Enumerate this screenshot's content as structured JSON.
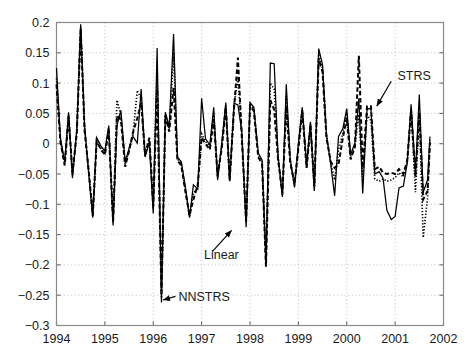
{
  "chart_data": {
    "type": "line",
    "title": "",
    "xlabel": "",
    "ylabel": "",
    "xlim": [
      1994,
      2002
    ],
    "ylim": [
      -0.3,
      0.2
    ],
    "grid": true,
    "legend_position": "none",
    "x_ticks": [
      1994,
      1995,
      1996,
      1997,
      1998,
      1999,
      2000,
      2001,
      2002
    ],
    "x_tick_labels": [
      "1994",
      "1995",
      "1996",
      "1997",
      "1998",
      "1999",
      "2000",
      "2001",
      "2002"
    ],
    "y_ticks": [
      0.2,
      0.15,
      0.1,
      0.05,
      0,
      -0.05,
      -0.1,
      -0.15,
      -0.2,
      -0.25,
      -0.3
    ],
    "y_tick_labels": [
      "0.2",
      "0.15",
      "0.1",
      "0.05",
      "0",
      "-0.05",
      "-0.1",
      "-0.15",
      "-0.2",
      "-0.25",
      "-0.3"
    ],
    "annotations": [
      {
        "text": "STRS",
        "label_x": 2001.05,
        "label_y": 0.112,
        "arrow_from_x": 2000.92,
        "arrow_from_y": 0.103,
        "arrow_to_x": 2000.62,
        "arrow_to_y": 0.062
      },
      {
        "text": "Linear",
        "label_x": 1997.05,
        "label_y": -0.183,
        "arrow_from_x": 1997.22,
        "arrow_from_y": -0.178,
        "arrow_to_x": 1997.62,
        "arrow_to_y": -0.143
      },
      {
        "text": "NNSTRS",
        "label_x": 1996.52,
        "label_y": -0.252,
        "arrow_from_x": 1996.46,
        "arrow_from_y": -0.252,
        "arrow_to_x": 1996.2,
        "arrow_to_y": -0.258
      }
    ],
    "series": [
      {
        "name": "Linear",
        "style": "solid",
        "x": [
          1994.0,
          1994.08,
          1994.17,
          1994.25,
          1994.33,
          1994.42,
          1994.5,
          1994.58,
          1994.67,
          1994.75,
          1994.83,
          1994.92,
          1995.0,
          1995.08,
          1995.17,
          1995.25,
          1995.33,
          1995.42,
          1995.5,
          1995.58,
          1995.67,
          1995.75,
          1995.83,
          1995.92,
          1996.0,
          1996.08,
          1996.17,
          1996.25,
          1996.33,
          1996.42,
          1996.5,
          1996.58,
          1996.67,
          1996.75,
          1996.83,
          1996.92,
          1997.0,
          1997.08,
          1997.17,
          1997.25,
          1997.33,
          1997.42,
          1997.5,
          1997.58,
          1997.67,
          1997.75,
          1997.83,
          1997.92,
          1998.0,
          1998.08,
          1998.17,
          1998.25,
          1998.33,
          1998.42,
          1998.5,
          1998.58,
          1998.67,
          1998.75,
          1998.83,
          1998.92,
          1999.0,
          1999.08,
          1999.17,
          1999.25,
          1999.33,
          1999.42,
          1999.5,
          1999.58,
          1999.67,
          1999.75,
          1999.83,
          1999.92,
          2000.0,
          2000.08,
          2000.17,
          2000.25,
          2000.33,
          2000.42,
          2000.5,
          2000.58,
          2000.67,
          2000.75,
          2000.83,
          2000.92,
          2001.0,
          2001.08,
          2001.17,
          2001.25,
          2001.33,
          2001.42,
          2001.5,
          2001.58,
          2001.67,
          2001.72
        ],
        "y": [
          0.125,
          0.01,
          -0.03,
          0.052,
          -0.057,
          0.024,
          0.197,
          0.03,
          -0.053,
          -0.122,
          0.01,
          -0.004,
          -0.012,
          0.03,
          -0.135,
          0.03,
          0.055,
          -0.03,
          -0.008,
          0.012,
          0.001,
          0.09,
          -0.022,
          0.002,
          -0.115,
          0.158,
          -0.262,
          0.052,
          0.028,
          0.181,
          -0.022,
          -0.03,
          -0.075,
          -0.122,
          -0.068,
          -0.075,
          0.075,
          0.008,
          -0.002,
          0.06,
          -0.06,
          0.003,
          0.068,
          -0.062,
          0.067,
          0.064,
          0.02,
          -0.138,
          0.068,
          0.06,
          -0.015,
          -0.027,
          -0.196,
          0.133,
          0.132,
          -0.02,
          -0.088,
          0.098,
          -0.024,
          -0.072,
          0.0,
          0.06,
          -0.035,
          0.036,
          -0.078,
          0.157,
          0.13,
          0.016,
          -0.035,
          -0.086,
          0.012,
          0.025,
          0.058,
          -0.018,
          0.002,
          0.075,
          -0.082,
          0.057,
          0.058,
          -0.05,
          -0.046,
          -0.057,
          -0.11,
          -0.125,
          -0.12,
          -0.073,
          -0.07,
          -0.032,
          0.065,
          -0.047,
          0.081,
          -0.08,
          -0.06,
          0.012
        ]
      },
      {
        "name": "STRS",
        "style": "dashed",
        "x": [
          1994.0,
          1994.08,
          1994.17,
          1994.25,
          1994.33,
          1994.42,
          1994.5,
          1994.58,
          1994.67,
          1994.75,
          1994.83,
          1994.92,
          1995.0,
          1995.08,
          1995.17,
          1995.25,
          1995.33,
          1995.42,
          1995.5,
          1995.58,
          1995.67,
          1995.75,
          1995.83,
          1995.92,
          1996.0,
          1996.08,
          1996.17,
          1996.25,
          1996.33,
          1996.42,
          1996.5,
          1996.58,
          1996.67,
          1996.75,
          1996.83,
          1996.92,
          1997.0,
          1997.08,
          1997.17,
          1997.25,
          1997.33,
          1997.42,
          1997.5,
          1997.58,
          1997.67,
          1997.75,
          1997.83,
          1997.92,
          1998.0,
          1998.08,
          1998.17,
          1998.25,
          1998.33,
          1998.42,
          1998.5,
          1998.58,
          1998.67,
          1998.75,
          1998.83,
          1998.92,
          1999.0,
          1999.08,
          1999.17,
          1999.25,
          1999.33,
          1999.42,
          1999.5,
          1999.58,
          1999.67,
          1999.75,
          1999.83,
          1999.92,
          2000.0,
          2000.08,
          2000.17,
          2000.25,
          2000.33,
          2000.42,
          2000.5,
          2000.58,
          2000.67,
          2000.75,
          2000.83,
          2000.92,
          2001.0,
          2001.08,
          2001.17,
          2001.25,
          2001.33,
          2001.42,
          2001.5,
          2001.58,
          2001.67,
          2001.72
        ],
        "y": [
          0.098,
          0.004,
          -0.036,
          0.045,
          -0.048,
          0.018,
          0.19,
          0.022,
          -0.048,
          -0.118,
          0.004,
          -0.01,
          -0.018,
          0.022,
          -0.128,
          0.046,
          0.04,
          -0.038,
          -0.012,
          0.018,
          0.042,
          0.068,
          -0.018,
          0.01,
          -0.104,
          0.09,
          -0.25,
          0.046,
          0.02,
          0.092,
          -0.028,
          -0.036,
          -0.082,
          -0.118,
          -0.092,
          -0.068,
          0.01,
          0.0,
          -0.01,
          0.04,
          -0.052,
          -0.005,
          0.06,
          -0.06,
          0.058,
          0.142,
          0.012,
          -0.128,
          0.062,
          0.054,
          -0.022,
          -0.033,
          -0.203,
          0.072,
          0.056,
          -0.026,
          -0.082,
          0.062,
          -0.03,
          -0.066,
          -0.008,
          0.054,
          -0.04,
          0.03,
          -0.07,
          0.14,
          0.118,
          0.01,
          -0.03,
          -0.04,
          -0.034,
          0.01,
          0.042,
          -0.026,
          -0.005,
          0.145,
          -0.04,
          0.062,
          0.062,
          -0.042,
          -0.038,
          -0.048,
          -0.05,
          -0.048,
          -0.05,
          -0.042,
          -0.05,
          -0.028,
          0.055,
          -0.055,
          0.052,
          -0.092,
          -0.078,
          0.002
        ]
      },
      {
        "name": "NNSTRS",
        "style": "dotted",
        "x": [
          1994.0,
          1994.08,
          1994.17,
          1994.25,
          1994.33,
          1994.42,
          1994.5,
          1994.58,
          1994.67,
          1994.75,
          1994.83,
          1994.92,
          1995.0,
          1995.08,
          1995.17,
          1995.25,
          1995.33,
          1995.42,
          1995.5,
          1995.58,
          1995.67,
          1995.75,
          1995.83,
          1995.92,
          1996.0,
          1996.08,
          1996.17,
          1996.25,
          1996.33,
          1996.42,
          1996.5,
          1996.58,
          1996.67,
          1996.75,
          1996.83,
          1996.92,
          1997.0,
          1997.08,
          1997.17,
          1997.25,
          1997.33,
          1997.42,
          1997.5,
          1997.58,
          1997.67,
          1997.75,
          1997.83,
          1997.92,
          1998.0,
          1998.08,
          1998.17,
          1998.25,
          1998.33,
          1998.42,
          1998.5,
          1998.58,
          1998.67,
          1998.75,
          1998.83,
          1998.92,
          1999.0,
          1999.08,
          1999.17,
          1999.25,
          1999.33,
          1999.42,
          1999.5,
          1999.58,
          1999.67,
          1999.75,
          1999.83,
          1999.92,
          2000.0,
          2000.08,
          2000.17,
          2000.25,
          2000.33,
          2000.42,
          2000.5,
          2000.58,
          2000.67,
          2000.75,
          2000.83,
          2000.92,
          2001.0,
          2001.08,
          2001.17,
          2001.25,
          2001.33,
          2001.42,
          2001.5,
          2001.58,
          2001.67,
          2001.72
        ],
        "y": [
          0.108,
          0.006,
          -0.034,
          0.048,
          -0.052,
          0.02,
          0.192,
          0.026,
          -0.05,
          -0.12,
          0.006,
          -0.008,
          -0.016,
          0.026,
          -0.13,
          0.072,
          0.048,
          -0.034,
          -0.01,
          0.015,
          0.088,
          0.074,
          -0.02,
          0.006,
          -0.108,
          0.12,
          -0.255,
          0.048,
          0.024,
          0.15,
          -0.025,
          -0.033,
          -0.078,
          -0.12,
          -0.082,
          -0.072,
          0.016,
          0.004,
          -0.006,
          0.05,
          -0.056,
          0.0,
          0.064,
          -0.061,
          0.062,
          0.11,
          0.016,
          -0.133,
          0.065,
          0.057,
          -0.018,
          -0.03,
          -0.199,
          0.1,
          0.09,
          -0.023,
          -0.085,
          0.08,
          -0.027,
          -0.069,
          -0.004,
          0.057,
          -0.038,
          0.033,
          -0.074,
          0.148,
          0.124,
          0.013,
          -0.032,
          -0.06,
          -0.01,
          0.018,
          0.05,
          -0.022,
          -0.002,
          0.048,
          -0.055,
          0.048,
          0.038,
          -0.058,
          -0.062,
          -0.058,
          -0.062,
          -0.06,
          -0.056,
          -0.048,
          -0.055,
          -0.03,
          0.058,
          -0.08,
          0.05,
          -0.155,
          -0.09,
          0.006
        ]
      }
    ]
  }
}
